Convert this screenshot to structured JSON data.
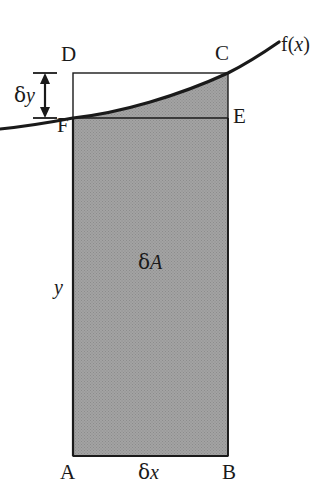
{
  "figure": {
    "type": "geometry-diagram",
    "background_color": "#ffffff",
    "line_color": "#1a1a1a",
    "shade_color": "#9a9a9a",
    "curve_label": "f(x)",
    "curve_label_parts": {
      "name": "f(",
      "variable": "x",
      "close": ")"
    },
    "vertices": [
      {
        "id": "A",
        "label": "A",
        "x": 73,
        "y": 456,
        "label_x": 60,
        "label_y": 462
      },
      {
        "id": "B",
        "label": "B",
        "x": 228,
        "y": 456,
        "label_x": 222,
        "label_y": 462
      },
      {
        "id": "C",
        "label": "C",
        "x": 228,
        "y": 73,
        "label_x": 215,
        "label_y": 43
      },
      {
        "id": "D",
        "label": "D",
        "x": 73,
        "y": 73,
        "label_x": 61,
        "label_y": 44
      },
      {
        "id": "E",
        "label": "E",
        "x": 228,
        "y": 118,
        "label_x": 233,
        "label_y": 106
      },
      {
        "id": "F",
        "label": "F",
        "x": 73,
        "y": 118,
        "label_x": 57,
        "label_y": 115
      }
    ],
    "annotations": [
      {
        "id": "delta-y",
        "greek": "δ",
        "variable": "y",
        "x": 20,
        "y": 85,
        "description": "height increment between DC and FE"
      },
      {
        "id": "delta-x",
        "greek": "δ",
        "variable": "x",
        "x": 141,
        "y": 462,
        "description": "width increment along AB"
      },
      {
        "id": "delta-a",
        "greek": "δ",
        "variable": "A",
        "x": 140,
        "y": 252,
        "description": "shaded area element"
      },
      {
        "id": "y",
        "greek": "",
        "variable": "y",
        "x": 54,
        "y": 277,
        "description": "ordinate height of the rectangle"
      }
    ],
    "rect": {
      "left": 73,
      "right": 228,
      "top": 73,
      "bottom": 456
    },
    "fe_line_y": 118,
    "curve": {
      "start": {
        "x": 0,
        "y": 129
      },
      "through_f": {
        "x": 73,
        "y": 118
      },
      "through_c": {
        "x": 228,
        "y": 73
      },
      "end": {
        "x": 279,
        "y": 42
      }
    }
  }
}
